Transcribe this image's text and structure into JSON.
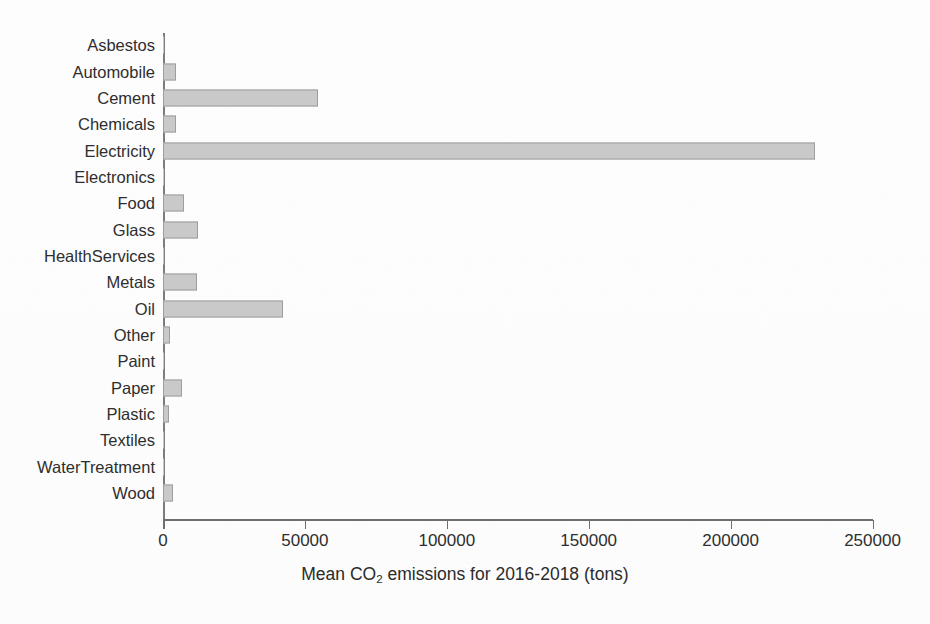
{
  "chart_data": {
    "type": "bar",
    "orientation": "horizontal",
    "title": "",
    "xlabel": "Mean CO₂ emissions for 2016-2018 (tons)",
    "xlabel_parts": {
      "before": "Mean CO",
      "subscript": "2",
      "after": " emissions for 2016-2018 (tons)"
    },
    "ylabel": "",
    "categories": [
      "Asbestos",
      "Automobile",
      "Cement",
      "Chemicals",
      "Electricity",
      "Electronics",
      "Food",
      "Glass",
      "HealthServices",
      "Metals",
      "Oil",
      "Other",
      "Paint",
      "Paper",
      "Plastic",
      "Textiles",
      "WaterTreatment",
      "Wood"
    ],
    "values": [
      200,
      4600,
      54700,
      4600,
      229900,
      300,
      7400,
      12300,
      150,
      12000,
      42300,
      2500,
      250,
      6700,
      2100,
      200,
      150,
      3500
    ],
    "xlim": [
      0,
      250000
    ],
    "xticks": [
      0,
      50000,
      100000,
      150000,
      200000,
      250000
    ],
    "xticklabels": [
      "0",
      "50000",
      "100000",
      "150000",
      "200000",
      "250000"
    ],
    "grid": false,
    "legend": false,
    "bar_color": "#c9c9c9",
    "bar_edge_color": "#9e9e9e",
    "axis_color": "#6f6f6f",
    "background_color": "#fdfdfd"
  }
}
